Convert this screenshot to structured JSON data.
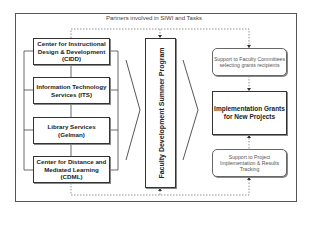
{
  "diagram": {
    "title": "Partners involved in SIWI and Tasks",
    "partners": [
      {
        "label": "Center for Instructional Design & Development (CIDD)"
      },
      {
        "label": "Information Technology Services (ITS)"
      },
      {
        "label": "Library Services (Gelman)"
      },
      {
        "label": "Center for Distance and Mediated Learning (CDML)"
      }
    ],
    "program": {
      "label": "Faculty Development Summer Program"
    },
    "tasks": {
      "support_top": "Support to Faculty Committees selecting grants recipients",
      "implementation": "Implementation Grants for New Projects",
      "support_bottom": "Support to Project Implementation & Results Tracking"
    }
  }
}
